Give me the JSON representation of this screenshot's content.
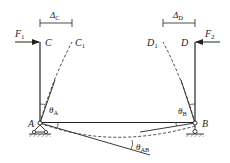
{
  "diagram": {
    "colors": {
      "line": "#222222",
      "background": "#ffffff"
    },
    "nodes": {
      "C": {
        "label": "C",
        "sub": ""
      },
      "C1": {
        "label": "C",
        "sub": "1"
      },
      "D": {
        "label": "D",
        "sub": ""
      },
      "D1": {
        "label": "D",
        "sub": "1"
      },
      "A": {
        "label": "A",
        "sub": ""
      },
      "B": {
        "label": "B",
        "sub": ""
      }
    },
    "forces": {
      "F1": {
        "label": "F",
        "sub": "1",
        "direction": "right"
      },
      "F2": {
        "label": "F",
        "sub": "2",
        "direction": "left"
      }
    },
    "dimensions": {
      "delta_C": {
        "label": "Δ",
        "sub": "C"
      },
      "delta_D": {
        "label": "Δ",
        "sub": "D"
      }
    },
    "angles": {
      "theta_A": {
        "label": "θ",
        "sub": "A"
      },
      "theta_B": {
        "label": "θ",
        "sub": "B"
      },
      "theta_AB": {
        "label": "θ",
        "sub": "AB"
      }
    },
    "supports": {
      "A": "pin-support",
      "B": "roller-support"
    }
  }
}
